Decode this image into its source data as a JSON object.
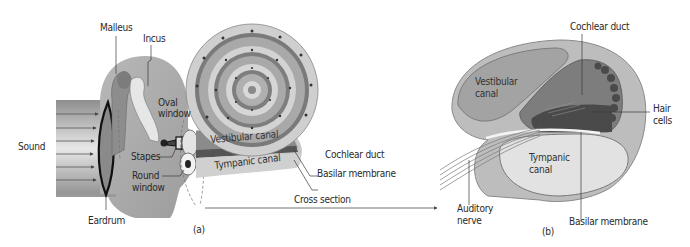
{
  "figure": {
    "panel_a": {
      "tag": "(a)",
      "labels": {
        "sound": "Sound",
        "malleus": "Malleus",
        "incus": "Incus",
        "oval_window_1": "Oval",
        "oval_window_2": "window",
        "stapes": "Stapes",
        "round_window_1": "Round",
        "round_window_2": "window",
        "eardrum": "Eardrum",
        "vestibular_canal": "Vestibular canal",
        "tympanic_canal": "Tympanic canal",
        "cochlear_duct": "Cochlear duct",
        "basilar_membrane": "Basilar membrane",
        "cross_section": "Cross section"
      }
    },
    "panel_b": {
      "tag": "(b)",
      "labels": {
        "cochlear_duct": "Cochlear duct",
        "vestibular_canal_1": "Vestibular",
        "vestibular_canal_2": "canal",
        "hair_cells_1": "Hair",
        "hair_cells_2": "cells",
        "tympanic_canal_1": "Tympanic",
        "tympanic_canal_2": "canal",
        "auditory_nerve_1": "Auditory",
        "auditory_nerve_2": "nerve",
        "basilar_membrane": "Basilar membrane"
      }
    },
    "colors": {
      "tissue": "#a7a7a7",
      "tissue_dark": "#8c8c8c",
      "canal_light": "#d6d6d6",
      "canal_mid": "#b9b9b9",
      "duct_dark": "#6b6b6b",
      "line": "#3a3a3a",
      "text": "#2a2a2a"
    }
  }
}
